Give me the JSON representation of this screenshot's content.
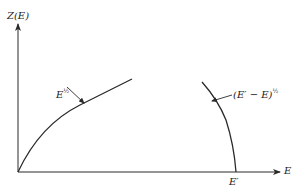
{
  "diagram": {
    "y_axis_label": "Z(E)",
    "x_axis_label": "E",
    "x_tick_label": "E′",
    "curve_left": {
      "base": "E",
      "exponent": "½",
      "description": "rising square-root curve from origin"
    },
    "curve_right": {
      "base": "(E′ − E)",
      "exponent": "½",
      "description": "falling curve reaching zero at E′"
    },
    "colors": {
      "line": "#2a2a2a",
      "background": "#ffffff"
    }
  }
}
